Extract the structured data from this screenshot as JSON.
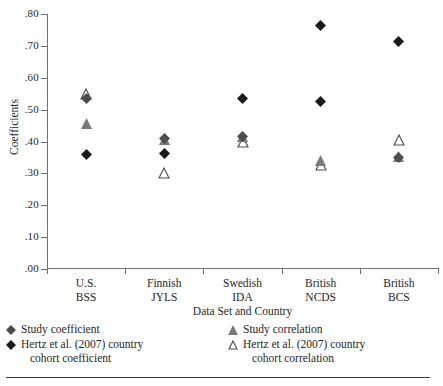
{
  "chart_data": {
    "type": "scatter",
    "title": "",
    "xlabel": "Data Set and Country",
    "ylabel": "Coefficients",
    "ylim": [
      0.0,
      0.8
    ],
    "ytick_labels": [
      ".80",
      ".70",
      ".60",
      ".50",
      ".40",
      ".30",
      ".20",
      ".10",
      ".00"
    ],
    "ytick_values": [
      0.8,
      0.7,
      0.6,
      0.5,
      0.4,
      0.3,
      0.2,
      0.1,
      0.0
    ],
    "grid": false,
    "legend_position": "below-axis",
    "categories": [
      {
        "line1": "U.S.",
        "line2": "BSS"
      },
      {
        "line1": "Finnish",
        "line2": "JYLS"
      },
      {
        "line1": "Swedish",
        "line2": "IDA"
      },
      {
        "line1": "British",
        "line2": "NCDS"
      },
      {
        "line1": "British",
        "line2": "BCS"
      }
    ],
    "series": [
      {
        "name": "Study coefficient",
        "marker": "filled-diamond",
        "color": "#4d4d4d",
        "values": [
          0.535,
          0.41,
          0.415,
          null,
          0.35
        ]
      },
      {
        "name": "Hertz et al. (2007) country cohort coefficient",
        "marker": "filled-diamond",
        "color": "#1a1a1a",
        "values": [
          0.36,
          0.363,
          0.535,
          0.763,
          0.715
        ]
      },
      {
        "name": "Study correlation",
        "marker": "filled-triangle",
        "color": "#7a7a7a",
        "values": [
          0.455,
          0.405,
          0.415,
          0.34,
          0.352
        ]
      },
      {
        "name": "Hertz et al. (2007) country cohort correlation",
        "marker": "open-triangle",
        "color": "#ffffff",
        "values": [
          0.55,
          0.3,
          0.4,
          0.325,
          0.405
        ]
      }
    ],
    "extra_points": [
      {
        "series": "Hertz et al. (2007) country cohort coefficient",
        "category": "British NCDS",
        "value": 0.527
      }
    ]
  },
  "legend": {
    "left": [
      {
        "marker": "filled-diamond-gray",
        "label": "Study coefficient",
        "label2": ""
      },
      {
        "marker": "filled-diamond-black",
        "label": "Hertz et al. (2007) country",
        "label2": "cohort coefficient"
      }
    ],
    "right": [
      {
        "marker": "filled-triangle-gray",
        "label": "Study correlation",
        "label2": ""
      },
      {
        "marker": "open-triangle",
        "label": "Hertz et al. (2007) country",
        "label2": "cohort correlation"
      }
    ]
  },
  "colors": {
    "axis": "#6e6e6e",
    "text": "#1f1f1f",
    "dark_marker": "#1a1a1a",
    "mid_marker": "#4d4d4d",
    "gray_marker": "#7a7a7a",
    "open_marker_stroke": "#4a4a4a",
    "rule": "#3a3a3a"
  }
}
